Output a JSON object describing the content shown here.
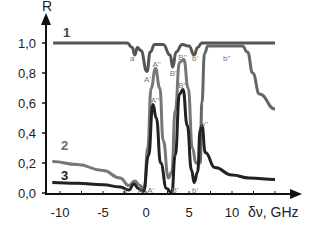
{
  "chart_data": {
    "type": "line",
    "title": "",
    "xlabel": "δν, GHz",
    "ylabel": "R",
    "xlim": [
      -11,
      13
    ],
    "ylim": [
      0.0,
      1.05
    ],
    "x_ticks": [
      -10,
      -5,
      0,
      5,
      10
    ],
    "x_tick_labels": [
      "-10",
      "-5",
      "0",
      "5",
      "10"
    ],
    "y_ticks": [
      0.0,
      0.2,
      0.4,
      0.6,
      0.8,
      1.0
    ],
    "y_tick_labels": [
      "0,0",
      "0,2",
      "0,4",
      "0,6",
      "0,8",
      "1,0"
    ],
    "grid": false,
    "legend": "inline numeric labels",
    "series": [
      {
        "name": "1",
        "color": "#555555",
        "points": [
          [
            -10.8,
            1.0
          ],
          [
            -2.2,
            1.0
          ],
          [
            -1.6,
            0.97
          ],
          [
            -1.3,
            0.92
          ],
          [
            -1.0,
            0.97
          ],
          [
            -0.6,
            0.95
          ],
          [
            0.1,
            0.81
          ],
          [
            0.5,
            0.94
          ],
          [
            1.0,
            0.99
          ],
          [
            2.0,
            0.99
          ],
          [
            2.8,
            0.92
          ],
          [
            3.1,
            0.84
          ],
          [
            3.5,
            0.94
          ],
          [
            4.2,
            0.99
          ],
          [
            5.0,
            0.98
          ],
          [
            5.6,
            0.92
          ],
          [
            6.0,
            0.97
          ],
          [
            6.5,
            1.0
          ],
          [
            15.0,
            1.0
          ]
        ]
      },
      {
        "name": "1 (lower branch)",
        "color": "#666666",
        "points": [
          [
            6.3,
            0.2
          ],
          [
            6.5,
            0.6
          ],
          [
            6.8,
            0.93
          ],
          [
            7.2,
            0.98
          ],
          [
            11.2,
            0.98
          ],
          [
            11.8,
            0.94
          ],
          [
            12.4,
            0.8
          ],
          [
            13.2,
            0.66
          ],
          [
            15.0,
            0.56
          ]
        ]
      },
      {
        "name": "2",
        "color": "#777777",
        "points": [
          [
            -10.9,
            0.21
          ],
          [
            -8,
            0.19
          ],
          [
            -5,
            0.15
          ],
          [
            -3,
            0.1
          ],
          [
            -2.0,
            0.05
          ],
          [
            -1.3,
            0.08
          ],
          [
            -0.7,
            0.05
          ],
          [
            -0.2,
            0.02
          ],
          [
            0.2,
            0.3
          ],
          [
            0.6,
            0.7
          ],
          [
            1.1,
            0.83
          ],
          [
            1.6,
            0.7
          ],
          [
            2.0,
            0.35
          ],
          [
            2.6,
            0.1
          ],
          [
            3.0,
            0.14
          ],
          [
            3.4,
            0.55
          ],
          [
            3.9,
            0.87
          ],
          [
            4.4,
            0.89
          ],
          [
            4.9,
            0.7
          ],
          [
            5.4,
            0.3
          ],
          [
            5.8,
            0.2
          ],
          [
            6.3,
            0.2
          ]
        ]
      },
      {
        "name": "3",
        "color": "#222222",
        "points": [
          [
            -10.9,
            0.07
          ],
          [
            -8,
            0.065
          ],
          [
            -5,
            0.055
          ],
          [
            -3,
            0.04
          ],
          [
            -2.0,
            0.02
          ],
          [
            -1.4,
            0.06
          ],
          [
            -0.9,
            0.03
          ],
          [
            -0.3,
            0.01
          ],
          [
            0.3,
            0.25
          ],
          [
            0.8,
            0.59
          ],
          [
            1.2,
            0.5
          ],
          [
            1.7,
            0.2
          ],
          [
            2.4,
            0.03
          ],
          [
            3.0,
            0.0
          ],
          [
            3.4,
            0.25
          ],
          [
            3.9,
            0.66
          ],
          [
            4.3,
            0.69
          ],
          [
            4.8,
            0.45
          ],
          [
            5.3,
            0.15
          ],
          [
            5.6,
            0.07
          ],
          [
            6.0,
            0.14
          ],
          [
            6.3,
            0.42
          ],
          [
            6.5,
            0.45
          ],
          [
            6.9,
            0.27
          ],
          [
            8,
            0.17
          ],
          [
            10,
            0.12
          ],
          [
            12,
            0.1
          ],
          [
            15,
            0.09
          ]
        ]
      }
    ],
    "annotations": [
      {
        "text": "a",
        "x": -1.5,
        "y": 0.9,
        "series": "1"
      },
      {
        "text": "A'",
        "x": 0.1,
        "y": 0.76,
        "series": "1"
      },
      {
        "text": "A''",
        "x": 1.1,
        "y": 0.86,
        "series": "2"
      },
      {
        "text": "A''",
        "x": 0.9,
        "y": 0.62,
        "series": "3"
      },
      {
        "text": "B'",
        "x": 3.1,
        "y": 0.8,
        "series": "1"
      },
      {
        "text": "B''",
        "x": 4.1,
        "y": 0.91,
        "series": "2"
      },
      {
        "text": "B''",
        "x": 4.1,
        "y": 0.72,
        "series": "3"
      },
      {
        "text": "b'",
        "x": 5.7,
        "y": 0.9,
        "series": "1"
      },
      {
        "text": "b''",
        "x": 9.3,
        "y": 0.9,
        "series": "1"
      },
      {
        "text": "b''",
        "x": 6.7,
        "y": 0.46,
        "series": "3"
      },
      {
        "text": "B'",
        "x": 3.3,
        "y": 0.02,
        "series": "3"
      },
      {
        "text": "b'",
        "x": 5.7,
        "y": 0.02,
        "series": "3"
      },
      {
        "text": "A'",
        "x": -0.6,
        "y": 0.02
      },
      {
        "text": "A'",
        "x": 0.5,
        "y": 0.02
      },
      {
        "text": "a",
        "x": -2.4,
        "y": 0.02
      }
    ]
  },
  "labels": {
    "y_axis": "R",
    "x_axis": "δν, GHz",
    "curve1": "1",
    "curve2": "2",
    "curve3": "3"
  }
}
